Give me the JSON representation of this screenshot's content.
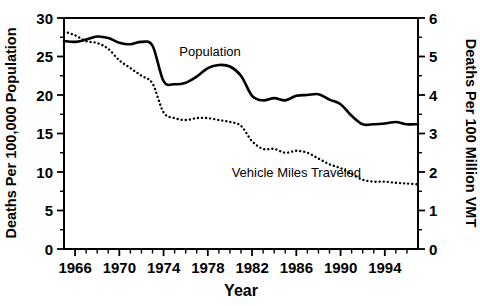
{
  "chart_data": {
    "type": "line",
    "title": "",
    "xlabel": "Year",
    "ylabel": "Deaths Per 100,000 Population",
    "ylabel_right": "Deaths Per 100 Million VMT",
    "xlim": [
      1965,
      1997
    ],
    "ylim": [
      0,
      30
    ],
    "ylim_right": [
      0,
      6
    ],
    "grid": false,
    "legend_position": "inline-annotation",
    "x_ticks_major": [
      1966,
      1970,
      1974,
      1978,
      1982,
      1986,
      1990,
      1994
    ],
    "x_tick_labels": [
      "1966",
      "1970",
      "1974",
      "1978",
      "1982",
      "1986",
      "1990",
      "1994"
    ],
    "x_ticks_minor_step": 1,
    "y_ticks_left": [
      0,
      5,
      10,
      15,
      20,
      25,
      30
    ],
    "y_tick_labels_left": [
      "0",
      "5",
      "10",
      "15",
      "20",
      "25",
      "30"
    ],
    "y_ticks_right": [
      0,
      1,
      2,
      3,
      4,
      5,
      6
    ],
    "y_tick_labels_right": [
      "0",
      "1",
      "2",
      "3",
      "4",
      "5",
      "6"
    ],
    "y_ticks_right_minor": [
      0.5,
      1.5,
      2.5,
      3.5,
      4.5,
      5.5
    ],
    "x": [
      1965,
      1966,
      1967,
      1968,
      1969,
      1970,
      1971,
      1972,
      1973,
      1974,
      1975,
      1976,
      1977,
      1978,
      1979,
      1980,
      1981,
      1982,
      1983,
      1984,
      1985,
      1986,
      1987,
      1988,
      1989,
      1990,
      1991,
      1992,
      1993,
      1994,
      1995,
      1996,
      1997
    ],
    "series": [
      {
        "name": "Population",
        "label": "Population",
        "style": "solid",
        "axis": "left",
        "units": "Deaths Per 100,000 Population",
        "values": [
          27.0,
          26.9,
          27.2,
          27.6,
          27.4,
          26.8,
          26.6,
          26.9,
          26.4,
          21.8,
          21.4,
          21.6,
          22.4,
          23.5,
          23.9,
          23.7,
          22.5,
          19.9,
          19.3,
          19.6,
          19.3,
          19.9,
          20.0,
          20.1,
          19.4,
          18.8,
          17.3,
          16.2,
          16.2,
          16.3,
          16.5,
          16.2,
          16.2
        ]
      },
      {
        "name": "Vehicle Miles Traveled",
        "label": "Vehicle Miles Traveled",
        "style": "dotted",
        "axis": "right",
        "units": "Deaths Per 100 Million VMT",
        "values": [
          5.65,
          5.55,
          5.4,
          5.35,
          5.2,
          4.9,
          4.7,
          4.5,
          4.3,
          3.55,
          3.4,
          3.35,
          3.4,
          3.4,
          3.35,
          3.3,
          3.2,
          2.8,
          2.6,
          2.6,
          2.5,
          2.55,
          2.5,
          2.35,
          2.2,
          2.1,
          1.95,
          1.8,
          1.75,
          1.75,
          1.72,
          1.7,
          1.68
        ]
      }
    ],
    "annotations": [
      {
        "text": "Population",
        "x": 1978.2,
        "y": 25.1,
        "series": "Population"
      },
      {
        "text": "Vehicle Miles Traveled",
        "x": 1986.0,
        "y": 9.3,
        "series": "Vehicle Miles Traveled"
      }
    ]
  }
}
